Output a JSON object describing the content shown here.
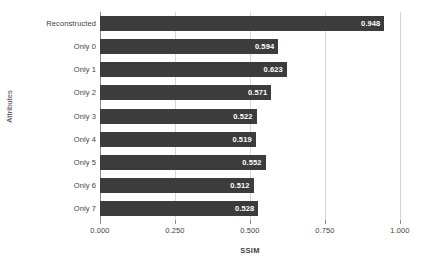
{
  "chart_data": {
    "type": "bar",
    "orientation": "horizontal",
    "title": "",
    "xlabel": "SSIM",
    "ylabel": "Attributes",
    "xlim": [
      0.0,
      1.0
    ],
    "xticks": [
      "0.000",
      "0.250",
      "0.500",
      "0.750",
      "1.000"
    ],
    "xtick_values": [
      0.0,
      0.25,
      0.5,
      0.75,
      1.0
    ],
    "grid": "vertical",
    "legend": "none",
    "bar_color": "#3c3c3c",
    "value_label_color": "#ffffff",
    "categories": [
      "Reconstructed",
      "Only 0",
      "Only 1",
      "Only 2",
      "Only 3",
      "Only 4",
      "Only 5",
      "Only 6",
      "Only 7"
    ],
    "values": [
      0.948,
      0.594,
      0.623,
      0.571,
      0.522,
      0.519,
      0.552,
      0.512,
      0.528
    ],
    "value_labels": [
      "0.948",
      "0.594",
      "0.623",
      "0.571",
      "0.522",
      "0.519",
      "0.552",
      "0.512",
      "0.528"
    ]
  }
}
